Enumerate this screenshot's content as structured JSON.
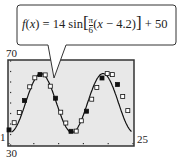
{
  "chart_data": {
    "type": "scatter",
    "title": "",
    "equation": {
      "lhs": "f(x)",
      "text": "f(x) = 14 sin[π/6(x − 4.2)] + 50",
      "amplitude": 14,
      "b_numerator": "π",
      "b_denominator": "6",
      "shift": "4.2",
      "vertical": "50"
    },
    "x_window": {
      "min": 1,
      "max": 25
    },
    "y_window": {
      "min": 30,
      "max": 70
    },
    "tick_labels": {
      "ymax": "70",
      "ymin": "30",
      "xmin": "1",
      "xmax": "25"
    },
    "xlabel": "",
    "ylabel": "",
    "grid": false,
    "series": [
      {
        "name": "data points",
        "marker": "square",
        "x": [
          1,
          2,
          3,
          4,
          5,
          6,
          7,
          8,
          9,
          10,
          11,
          12,
          13,
          14,
          15,
          16,
          17,
          18,
          19,
          20,
          21,
          22,
          23,
          24
        ],
        "y": [
          37.2,
          40.6,
          45.5,
          51.2,
          57.7,
          62.0,
          63.5,
          63.4,
          58.0,
          52.3,
          45.6,
          40.5,
          36.5,
          36.6,
          41.5,
          46.1,
          51.8,
          57.4,
          61.9,
          64.0,
          63.5,
          58.8,
          53.1,
          46.4
        ]
      },
      {
        "name": "model curve",
        "type": "line",
        "function": "14*sin(pi/6*(x-4.2))+50"
      }
    ],
    "colors": {
      "screen_bg": "#e8e8e8",
      "frame": "#333333",
      "curve": "#111111"
    }
  }
}
